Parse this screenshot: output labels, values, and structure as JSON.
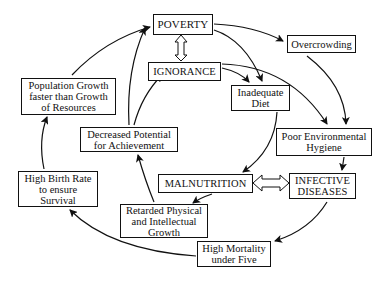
{
  "diagram": {
    "title": "",
    "nodes": {
      "poverty": "POVERTY",
      "ignorance": "IGNORANCE",
      "overcrowding": "Overcrowding",
      "inadequate_diet": "Inadequate\nDiet",
      "poor_hygiene": "Poor Environmental\nHygiene",
      "population_growth": "Population Growth\nfaster than Growth\nof Resources",
      "decreased_potential": "Decreased Potential\nfor Achievement",
      "high_birth_rate": "High Birth Rate\nto ensure\nSurvival",
      "malnutrition": "MALNUTRITION",
      "infective_diseases": "INFECTIVE\nDISEASES",
      "retarded_growth": "Retarded Physical\nand Intellectual\nGrowth",
      "high_mortality": "High Mortality\nunder Five"
    },
    "edges": [
      {
        "from": "poverty",
        "to": "ignorance",
        "type": "bidirectional"
      },
      {
        "from": "poverty",
        "to": "overcrowding"
      },
      {
        "from": "poverty",
        "to": "inadequate_diet"
      },
      {
        "from": "ignorance",
        "to": "inadequate_diet"
      },
      {
        "from": "ignorance",
        "to": "poor_hygiene"
      },
      {
        "from": "overcrowding",
        "to": "poor_hygiene"
      },
      {
        "from": "inadequate_diet",
        "to": "malnutrition"
      },
      {
        "from": "poor_hygiene",
        "to": "infective_diseases"
      },
      {
        "from": "malnutrition",
        "to": "infective_diseases",
        "type": "bidirectional"
      },
      {
        "from": "malnutrition",
        "to": "retarded_growth"
      },
      {
        "from": "infective_diseases",
        "to": "high_mortality"
      },
      {
        "from": "retarded_growth",
        "to": "decreased_potential"
      },
      {
        "from": "decreased_potential",
        "to": "poverty"
      },
      {
        "from": "decreased_potential",
        "to": "ignorance"
      },
      {
        "from": "high_mortality",
        "to": "high_birth_rate"
      },
      {
        "from": "high_birth_rate",
        "to": "population_growth"
      },
      {
        "from": "population_growth",
        "to": "poverty"
      }
    ]
  }
}
